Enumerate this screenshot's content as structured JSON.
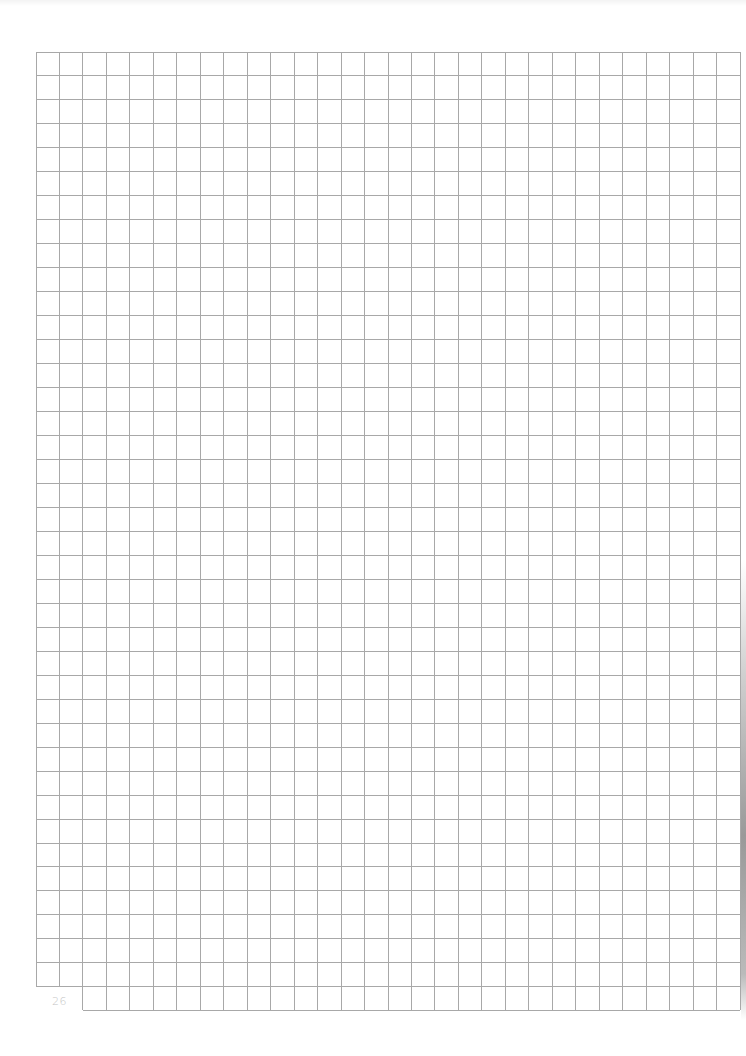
{
  "page": {
    "number": "26",
    "type": "graph-paper"
  },
  "grid": {
    "left": 36,
    "top": 52,
    "columns": 30,
    "rows": 39,
    "cell_width": 23.47,
    "cell_height": 23.97,
    "line_color": "#a8a8a8",
    "extension_row": {
      "start_column": 2,
      "end_column": 30,
      "height": 23.5
    }
  }
}
